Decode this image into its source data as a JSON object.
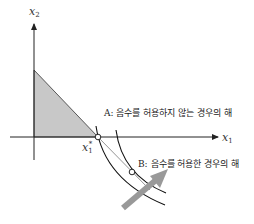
{
  "diagram": {
    "axes": {
      "x_label": "x",
      "x_sub": "1",
      "y_label": "x",
      "y_sub": "2"
    },
    "points": {
      "a_label": "A: 음수를 허용하지 않는 경우의 해",
      "b_label": "B: 음수를 허용한 경우의 해",
      "x1_star_label": "x",
      "x1_star_sub": "1",
      "x1_star_sup": "*"
    },
    "colors": {
      "feasible_region": "#c8c8c8",
      "axis": "#222222",
      "curve": "#111111",
      "constraint_line": "#888888",
      "direction_arrow": "#999999"
    }
  }
}
